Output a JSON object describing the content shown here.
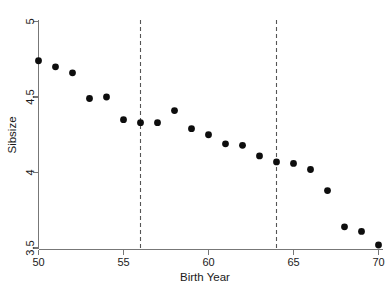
{
  "chart_data": {
    "type": "scatter",
    "title": "",
    "subtitle": "",
    "xlabel": "Birth Year",
    "ylabel": "Sibsize",
    "xlim": [
      49.3,
      70.8
    ],
    "ylim": [
      3.46,
      5.04
    ],
    "grid": false,
    "legend": null,
    "xticks": [
      50,
      55,
      60,
      65,
      70
    ],
    "xtick_labels": [
      "50",
      "55",
      "60",
      "65",
      "70"
    ],
    "yticks": [
      3.5,
      4,
      4.5,
      5
    ],
    "ytick_labels": [
      "3.5",
      "4",
      "4.5",
      "5"
    ],
    "x": [
      50,
      51,
      52,
      53,
      54,
      55,
      56,
      57,
      58,
      59,
      60,
      61,
      62,
      63,
      64,
      65,
      66,
      67,
      68,
      69,
      70
    ],
    "y": [
      4.74,
      4.7,
      4.66,
      4.49,
      4.5,
      4.35,
      4.33,
      4.33,
      4.41,
      4.29,
      4.25,
      4.19,
      4.18,
      4.11,
      4.07,
      4.06,
      4.02,
      3.88,
      3.64,
      3.61,
      3.52
    ],
    "series": [
      {
        "name": "Sibsize by birth year",
        "marker": "filled-circle",
        "color": "#0d0d0d",
        "values": [
          4.74,
          4.7,
          4.66,
          4.49,
          4.5,
          4.35,
          4.33,
          4.33,
          4.41,
          4.29,
          4.25,
          4.19,
          4.18,
          4.11,
          4.07,
          4.06,
          4.02,
          3.88,
          3.64,
          3.61,
          3.52
        ]
      }
    ],
    "annotations": [
      {
        "type": "vline",
        "x": 56,
        "style": "dashed",
        "color": "#555555"
      },
      {
        "type": "vline",
        "x": 64,
        "style": "dashed",
        "color": "#555555"
      }
    ]
  },
  "colors": {
    "marker": "#0d0d0d",
    "axis": "#777777",
    "vline": "#555555",
    "text": "#1a1a1a",
    "background": "#ffffff"
  }
}
